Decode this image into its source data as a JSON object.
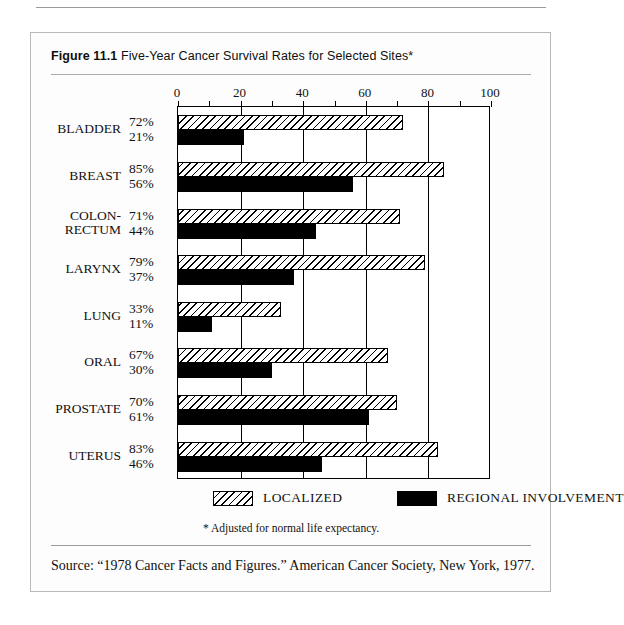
{
  "figure": {
    "label": "Figure 11.1",
    "title": "Five-Year Cancer Survival Rates for Selected Sites*",
    "footnote": "* Adjusted for normal life expectancy.",
    "source": "Source: “1978 Cancer Facts and Figures.” American Cancer Society, New York, 1977."
  },
  "legend": {
    "items": [
      {
        "label": "LOCALIZED",
        "pattern": "diagonal-hatch",
        "color": "#ffffff"
      },
      {
        "label": "REGIONAL INVOLVEMENT",
        "pattern": "solid",
        "color": "#000000"
      }
    ]
  },
  "chart_data": {
    "type": "bar",
    "orientation": "horizontal",
    "title": "Five-Year Cancer Survival Rates for Selected Sites*",
    "xlabel": "",
    "ylabel": "",
    "xlim": [
      0,
      100
    ],
    "xticks": [
      0,
      20,
      40,
      60,
      80,
      100
    ],
    "xtick_labels": [
      "0",
      "20",
      "40",
      "60",
      "80",
      "100"
    ],
    "minor_xticks": [
      10,
      30,
      50,
      70,
      90
    ],
    "grid": true,
    "legend_position": "bottom",
    "categories": [
      "BLADDER",
      "BREAST",
      "COLON-RECTUM",
      "LARYNX",
      "LUNG",
      "ORAL",
      "PROSTATE",
      "UTERUS"
    ],
    "series": [
      {
        "name": "LOCALIZED",
        "values": [
          72,
          85,
          71,
          79,
          33,
          67,
          70,
          83
        ],
        "labels": [
          "72%",
          "85%",
          "71%",
          "79%",
          "33%",
          "67%",
          "70%",
          "83%"
        ]
      },
      {
        "name": "REGIONAL INVOLVEMENT",
        "values": [
          21,
          56,
          44,
          37,
          11,
          30,
          61,
          46
        ],
        "labels": [
          "21%",
          "56%",
          "44%",
          "37%",
          "11%",
          "30%",
          "61%",
          "46%"
        ]
      }
    ]
  }
}
